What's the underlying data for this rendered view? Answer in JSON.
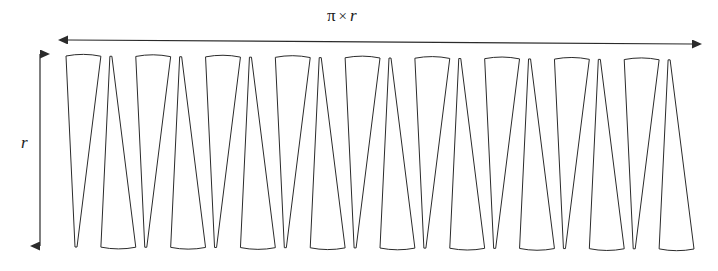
{
  "figure": {
    "kind": "geometry-diagram",
    "background_color": "#ffffff",
    "stroke_color": "#2b2b2b",
    "fill_color": "#ffffff",
    "stroke_width": 1
  },
  "labels": {
    "width": {
      "pi": "π",
      "times": "×",
      "radius": "r",
      "full_text": "π × r"
    },
    "height": {
      "radius": "r",
      "full_text": "r"
    }
  },
  "arrows": {
    "horizontal": {
      "name": "width-dimension-arrow",
      "x1": 68,
      "y1": 40,
      "x2": 692,
      "y2": 44,
      "double_headed": true
    },
    "vertical": {
      "name": "height-dimension-arrow",
      "x1": 40,
      "y1": 54,
      "x2": 40,
      "y2": 246,
      "double_headed": true
    }
  },
  "chart_data": {
    "type": "diagram",
    "sector_count": 18,
    "band": {
      "left": 66,
      "right": 694,
      "top": 56,
      "bottom": 247,
      "top_slope": 4,
      "bottom_slope": 2
    },
    "geometry_note": "18 alternating up/down thin sectors; top and bottom edges are shallow arcs",
    "arc_bulge": 3.5,
    "slant": 9
  }
}
